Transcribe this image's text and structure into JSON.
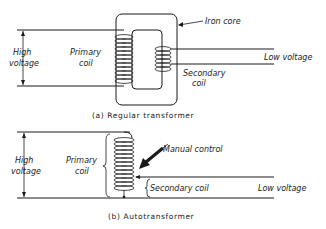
{
  "diagram_a": {
    "caption": "(a)  Regular  transformer",
    "labels": {
      "high_voltage_line1": "High",
      "high_voltage_line2": "voltage",
      "primary_coil_line1": "Primary",
      "primary_coil_line2": "coil",
      "iron_core": "Iron core",
      "low_voltage": "Low voltage",
      "secondary_coil_line1": "Secondary",
      "secondary_coil_line2": "coil"
    }
  },
  "diagram_b": {
    "caption": "(b)  Autotransformer",
    "labels": {
      "high_voltage_line1": "High",
      "high_voltage_line2": "voltage",
      "primary_coil_line1": "Primary",
      "primary_coil_line2": "coil",
      "manual_control": "Manual control",
      "secondary_coil": "Secondary coil",
      "low_voltage": "Low voltage"
    }
  },
  "colors": {
    "ink": "#1a1a1a",
    "background": "#ffffff"
  }
}
